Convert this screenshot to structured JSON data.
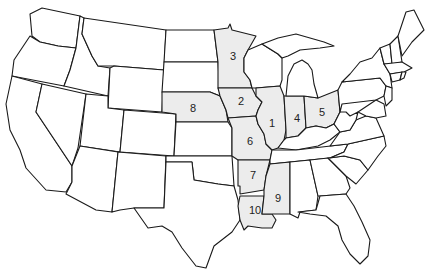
{
  "map": {
    "title": "",
    "region": "Contiguous United States",
    "fill_highlight": "#ececec",
    "fill_default": "#ffffff",
    "stroke": "#1a1a1a",
    "labels": [
      {
        "id": "1",
        "state": "Illinois",
        "x": 272,
        "y": 124
      },
      {
        "id": "2",
        "state": "Iowa",
        "x": 241,
        "y": 102
      },
      {
        "id": "3",
        "state": "Minnesota",
        "x": 233,
        "y": 57
      },
      {
        "id": "4",
        "state": "Indiana",
        "x": 297,
        "y": 119
      },
      {
        "id": "5",
        "state": "Ohio",
        "x": 322,
        "y": 113
      },
      {
        "id": "6",
        "state": "Missouri",
        "x": 250,
        "y": 142
      },
      {
        "id": "7",
        "state": "Arkansas",
        "x": 253,
        "y": 176
      },
      {
        "id": "8",
        "state": "Nebraska",
        "x": 193,
        "y": 109
      },
      {
        "id": "9",
        "state": "Mississippi",
        "x": 278,
        "y": 199
      },
      {
        "id": "10",
        "state": "Louisiana",
        "x": 255,
        "y": 211
      }
    ]
  }
}
